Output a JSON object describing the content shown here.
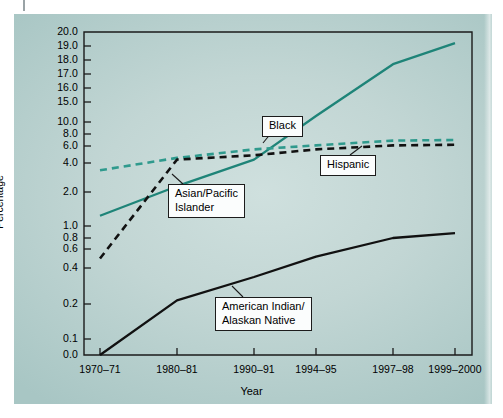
{
  "figure": {
    "background_color": "#bcd4d2",
    "panel_border": "none"
  },
  "chart_data": {
    "type": "line",
    "title": "",
    "xlabel": "Year",
    "ylabel": "Percentage",
    "grid": false,
    "legend_position": "inline-callouts",
    "y_axis_scale": "piecewise-nonlinear",
    "x": [
      "1970–71",
      "1980–81",
      "1990–91",
      "1994–95",
      "1997–98",
      "1999–2000"
    ],
    "y_ticks": [
      0.0,
      0.1,
      0.2,
      0.4,
      0.6,
      0.8,
      1.0,
      2.0,
      4.0,
      6.0,
      8.0,
      10.0,
      15.0,
      16.0,
      17.0,
      18.0,
      19.0,
      20.0
    ],
    "y_tick_labels": [
      "0.0",
      "0.1",
      "0.2",
      "0.4",
      "0.6",
      "0.8",
      "1.0",
      "2.0",
      "4.0",
      "6.0",
      "8.0",
      "10.0",
      "15.0",
      "16.0",
      "17.0",
      "18.0",
      "19.0",
      "20.0"
    ],
    "ylim": [
      0.0,
      20.0
    ],
    "series": [
      {
        "name": "Asian/Pacific Islander",
        "color": "#1e8478",
        "style": "solid",
        "values": [
          1.3,
          2.4,
          4.4,
          11.5,
          17.7,
          19.2
        ]
      },
      {
        "name": "Black",
        "color": "#2f9a8d",
        "style": "dashed",
        "values": [
          3.5,
          4.6,
          5.6,
          6.1,
          6.9,
          7.0
        ]
      },
      {
        "name": "Hispanic",
        "color": "#111111",
        "style": "dashed",
        "values": [
          0.5,
          4.4,
          4.9,
          5.6,
          6.1,
          6.2
        ]
      },
      {
        "name": "American Indian/Alaskan Native",
        "color": "#111111",
        "style": "solid",
        "values": [
          0.0,
          0.22,
          0.35,
          0.52,
          0.8,
          0.88
        ]
      }
    ]
  },
  "callouts": [
    {
      "id": "black",
      "label": "Black"
    },
    {
      "id": "hispanic",
      "label": "Hispanic"
    },
    {
      "id": "asian",
      "label": "Asian/Pacific\nIslander",
      "line1": "Asian/Pacific",
      "line2": "Islander"
    },
    {
      "id": "aian",
      "label": "American Indian/\nAlaskan Native",
      "line1": "American Indian/",
      "line2": "Alaskan Native"
    }
  ]
}
